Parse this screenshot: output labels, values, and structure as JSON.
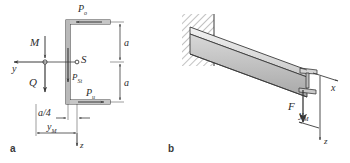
{
  "figure": {
    "caption_a": "a",
    "caption_b": "b",
    "panel_a": {
      "title": "C-channel cross-section with shear forces",
      "labels": {
        "force_top": "P",
        "force_top_sub": "o",
        "force_bottom": "P",
        "force_bottom_sub": "u",
        "force_web": "P",
        "force_web_sub": "St",
        "shear_center": "S",
        "moment": "M",
        "shear_force": "Q",
        "axis_y": "y",
        "axis_z": "z",
        "dim_top": "a",
        "dim_bottom": "a",
        "dim_offset": "a/4",
        "dim_ym": "y",
        "dim_ym_sub": "M"
      }
    },
    "panel_b": {
      "title": "Cantilever beam with end load",
      "labels": {
        "load": "F",
        "axis_x": "x",
        "axis_z": "z",
        "dim_ym": "y",
        "dim_ym_sub": "M"
      }
    }
  },
  "colors": {
    "ink": "#2b2b2b",
    "line": "#4a4a4a",
    "fill_light": "#e8e8e8",
    "fill_mid": "#cfcfcf",
    "fill_dark": "#b4b4b4",
    "hatch": "#555555",
    "background": "#ffffff"
  }
}
